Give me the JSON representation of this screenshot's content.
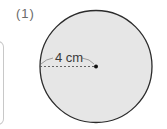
{
  "problem": {
    "label": "(1)"
  },
  "figure": {
    "shape": "circle",
    "radius_label": "4 cm",
    "fill_color": "#e6e6e6",
    "stroke_color": "#2b2b2b",
    "center_dot": true,
    "radius_line_style": "dashed"
  }
}
